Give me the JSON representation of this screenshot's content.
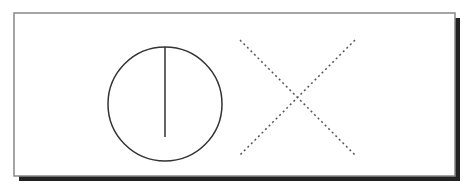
{
  "figure": {
    "frame": {
      "x": 14,
      "y": 13,
      "width": 441,
      "height": 163,
      "border_color": "#888888",
      "shadow_color": "#222222",
      "shadow_offset": 5
    },
    "circle": {
      "cx": 165,
      "cy": 104,
      "r": 57,
      "stroke": "#333333",
      "stroke_width": 1.5
    },
    "circle_line": {
      "x1": 165,
      "y1": 47,
      "x2": 165,
      "y2": 137,
      "stroke": "#333333"
    },
    "cross": {
      "lines": [
        {
          "x1": 240,
          "y1": 40,
          "x2": 355,
          "y2": 155
        },
        {
          "x1": 355,
          "y1": 40,
          "x2": 240,
          "y2": 155
        }
      ],
      "stroke": "#555555",
      "dash": "2,3"
    }
  }
}
